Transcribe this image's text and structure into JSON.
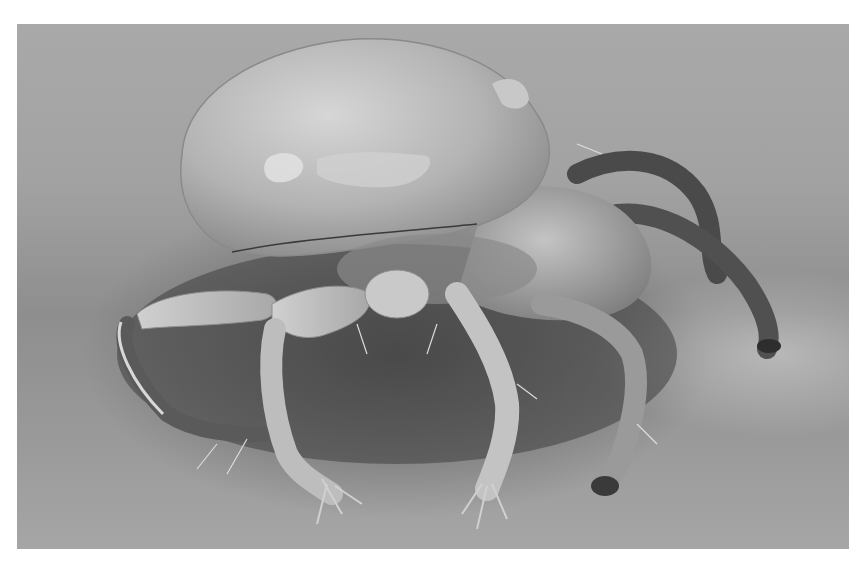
{
  "image": {
    "subject": "scanning electron micrograph of a mite",
    "style": "grayscale",
    "colors": {
      "page_background": "#ffffff",
      "substrate_light": "#a9a9a9",
      "substrate_shadow": "#5a5a5a",
      "body_highlight": "#d8d8d8",
      "body_mid": "#b5b5b5",
      "leg_dark": "#4a4a4a"
    }
  }
}
